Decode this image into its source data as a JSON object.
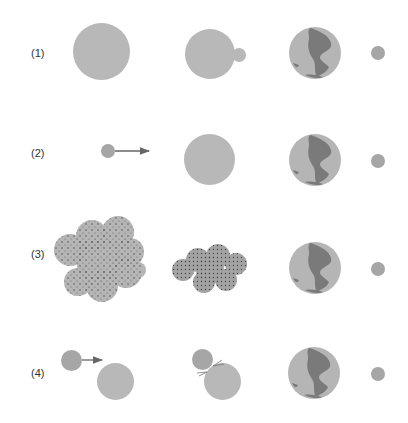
{
  "diagram": {
    "title": "",
    "rows": [
      {
        "label": "(1)",
        "stages": [
          "large-body",
          "large-body-with-bud",
          "earth",
          "moon"
        ]
      },
      {
        "label": "(2)",
        "stages": [
          "small-body-with-arrow",
          "large-body",
          "earth",
          "moon"
        ]
      },
      {
        "label": "(3)",
        "stages": [
          "particle-cloud",
          "condensed-cloud",
          "earth",
          "moon"
        ]
      },
      {
        "label": "(4)",
        "stages": [
          "impactor-approach",
          "impact-collision",
          "earth",
          "moon"
        ]
      }
    ],
    "colors": {
      "body": "#b8b8b8",
      "dark_body": "#a6a6a6",
      "land": "#7a7a7a",
      "arrow": "#666666"
    }
  }
}
